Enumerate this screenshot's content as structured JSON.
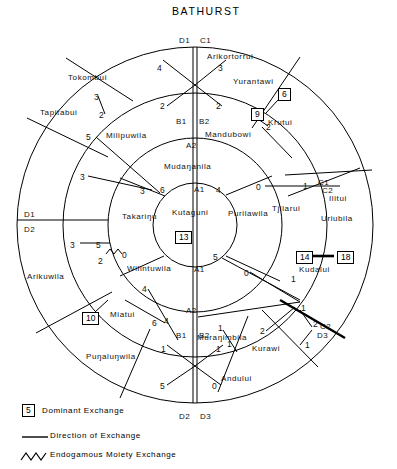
{
  "title": "BATHURST",
  "diagram": {
    "type": "concentric-ring-kinship-exchange",
    "center": {
      "x": 195,
      "y": 225
    },
    "rings": [
      {
        "name": "inner",
        "radius": 42,
        "label": "Kutaguni"
      },
      {
        "name": "second",
        "radius": 85
      },
      {
        "name": "third",
        "radius": 130
      },
      {
        "name": "outer",
        "radius": 175
      }
    ]
  },
  "moiety_labels": [
    {
      "text": "D1",
      "x": 179,
      "y": 36
    },
    {
      "text": "C1",
      "x": 200,
      "y": 36
    },
    {
      "text": "B1",
      "x": 176,
      "y": 117
    },
    {
      "text": "B2",
      "x": 199,
      "y": 117
    },
    {
      "text": "A2",
      "x": 186,
      "y": 141
    },
    {
      "text": "A1",
      "x": 194,
      "y": 185
    },
    {
      "text": "A1",
      "x": 194,
      "y": 265
    },
    {
      "text": "A2",
      "x": 186,
      "y": 306
    },
    {
      "text": "B1",
      "x": 176,
      "y": 331
    },
    {
      "text": "B2",
      "x": 199,
      "y": 331
    },
    {
      "text": "D2",
      "x": 179,
      "y": 412
    },
    {
      "text": "D3",
      "x": 200,
      "y": 412
    },
    {
      "text": "D1",
      "x": 24,
      "y": 210
    },
    {
      "text": "D2",
      "x": 24,
      "y": 225
    },
    {
      "text": "C1",
      "x": 318,
      "y": 178
    },
    {
      "text": "C2",
      "x": 322,
      "y": 186
    },
    {
      "text": "C2",
      "x": 320,
      "y": 322
    },
    {
      "text": "D3",
      "x": 317,
      "y": 331
    }
  ],
  "clan_labels": [
    {
      "text": "Arikortorrui",
      "x": 207,
      "y": 52
    },
    {
      "text": "Tokombui",
      "x": 68,
      "y": 73
    },
    {
      "text": "Yurantawi",
      "x": 233,
      "y": 77
    },
    {
      "text": "Tapitabui",
      "x": 40,
      "y": 108
    },
    {
      "text": "Milipuwila",
      "x": 106,
      "y": 131
    },
    {
      "text": "Mandubowi",
      "x": 205,
      "y": 130
    },
    {
      "text": "Krutui",
      "x": 268,
      "y": 118
    },
    {
      "text": "Mudaŋanila",
      "x": 164,
      "y": 162
    },
    {
      "text": "Ilitui",
      "x": 329,
      "y": 194
    },
    {
      "text": "Kutaguni",
      "x": 172,
      "y": 208
    },
    {
      "text": "Purilawila",
      "x": 228,
      "y": 209
    },
    {
      "text": "Tjilarui",
      "x": 272,
      "y": 204
    },
    {
      "text": "Uriubila",
      "x": 321,
      "y": 214
    },
    {
      "text": "Takariŋu",
      "x": 122,
      "y": 212
    },
    {
      "text": "Arikuwila",
      "x": 27,
      "y": 272
    },
    {
      "text": "Wilintuwila",
      "x": 127,
      "y": 264
    },
    {
      "text": "Kudalui",
      "x": 299,
      "y": 265
    },
    {
      "text": "Miatui",
      "x": 110,
      "y": 310
    },
    {
      "text": "Muraŋimbila",
      "x": 197,
      "y": 333
    },
    {
      "text": "Kurawi",
      "x": 252,
      "y": 344
    },
    {
      "text": "Puŋaluŋwila",
      "x": 86,
      "y": 352
    },
    {
      "text": "Andului",
      "x": 221,
      "y": 374
    }
  ],
  "exchange_numbers": [
    {
      "value": "4",
      "x": 157,
      "y": 63
    },
    {
      "value": "3",
      "x": 218,
      "y": 63
    },
    {
      "value": "2",
      "x": 160,
      "y": 101
    },
    {
      "value": "2",
      "x": 216,
      "y": 101
    },
    {
      "value": "3",
      "x": 94,
      "y": 92
    },
    {
      "value": "2",
      "x": 99,
      "y": 110
    },
    {
      "value": "5",
      "x": 86,
      "y": 132
    },
    {
      "value": "3",
      "x": 80,
      "y": 172
    },
    {
      "value": "3",
      "x": 140,
      "y": 186
    },
    {
      "value": "6",
      "x": 160,
      "y": 185
    },
    {
      "value": "4",
      "x": 216,
      "y": 185
    },
    {
      "value": "0",
      "x": 256,
      "y": 182
    },
    {
      "value": "1",
      "x": 303,
      "y": 181
    },
    {
      "value": "2",
      "x": 266,
      "y": 122
    },
    {
      "value": "3",
      "x": 70,
      "y": 240
    },
    {
      "value": "5",
      "x": 96,
      "y": 240
    },
    {
      "value": "2",
      "x": 98,
      "y": 256
    },
    {
      "value": "0",
      "x": 122,
      "y": 250
    },
    {
      "value": "5",
      "x": 213,
      "y": 252
    },
    {
      "value": "0",
      "x": 244,
      "y": 268
    },
    {
      "value": "1",
      "x": 291,
      "y": 274
    },
    {
      "value": "4",
      "x": 142,
      "y": 284
    },
    {
      "value": "6",
      "x": 152,
      "y": 318
    },
    {
      "value": "4",
      "x": 164,
      "y": 316
    },
    {
      "value": "1",
      "x": 218,
      "y": 323
    },
    {
      "value": "1",
      "x": 227,
      "y": 339
    },
    {
      "value": "1",
      "x": 301,
      "y": 303
    },
    {
      "value": "2",
      "x": 260,
      "y": 326
    },
    {
      "value": "2",
      "x": 313,
      "y": 319
    },
    {
      "value": "1",
      "x": 305,
      "y": 340
    },
    {
      "value": "1",
      "x": 161,
      "y": 344
    },
    {
      "value": "1",
      "x": 216,
      "y": 344
    },
    {
      "value": "5",
      "x": 160,
      "y": 381
    },
    {
      "value": "0",
      "x": 212,
      "y": 381
    }
  ],
  "dominant_exchange_boxes": [
    {
      "value": "6",
      "x": 278,
      "y": 88
    },
    {
      "value": "9",
      "x": 251,
      "y": 108
    },
    {
      "value": "13",
      "x": 175,
      "y": 231
    },
    {
      "value": "14",
      "x": 296,
      "y": 251
    },
    {
      "value": "18",
      "x": 337,
      "y": 251
    },
    {
      "value": "10",
      "x": 82,
      "y": 312
    }
  ],
  "legend": {
    "items": [
      {
        "key": "5",
        "symbol": "box",
        "label": "Dominant Exchange"
      },
      {
        "key": "",
        "symbol": "line",
        "label": "Direction of Exchange"
      },
      {
        "key": "",
        "symbol": "zigzag",
        "label": "Endogamous Moiety Exchange"
      }
    ]
  },
  "colors": {
    "stroke": "#000000",
    "background": "#ffffff"
  }
}
